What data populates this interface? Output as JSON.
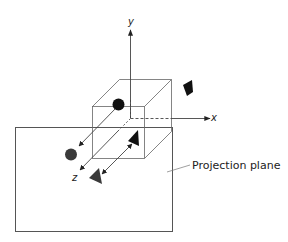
{
  "diagram": {
    "type": "orthographic-projection",
    "colors": {
      "line": "#555555",
      "dark_object": "#111111",
      "projected_object": "#444444",
      "background": "#ffffff"
    },
    "axes": {
      "x_label": "x",
      "y_label": "y",
      "z_label": "z"
    },
    "labels": {
      "projection_plane": "Projection plane"
    },
    "objects": [
      {
        "name": "sphere",
        "original": "black circle inside cube",
        "projection": "gray circle on plane"
      },
      {
        "name": "triangle",
        "original": "black triangle inside cube",
        "projection": "gray triangle on plane"
      },
      {
        "name": "trapezoid",
        "original": "black quadrilateral outside cube",
        "projection": "none"
      }
    ]
  }
}
